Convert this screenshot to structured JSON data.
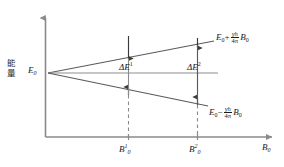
{
  "diagram": {
    "axes": {
      "y_label_chars": [
        "能",
        "量"
      ],
      "y_label_text": "能量",
      "x_label": "B",
      "x_label_sub": "0",
      "origin_label": "E",
      "origin_label_sub": "0"
    },
    "ticks": [
      {
        "name": "first-field-tick",
        "symbol": "B",
        "sub": "0",
        "sup": "1"
      },
      {
        "name": "second-field-tick",
        "symbol": "B",
        "sub": "0",
        "sup": "2"
      }
    ],
    "gaps": [
      {
        "name": "delta-e-1",
        "symbol": "ΔE",
        "sup": "1"
      },
      {
        "name": "delta-e-2",
        "symbol": "ΔE",
        "sup": "2"
      }
    ],
    "branches": [
      {
        "name": "upper-branch",
        "base": "E",
        "base_sub": "0",
        "operator": "+",
        "numerator": "γh",
        "denominator": "4π",
        "field": "B",
        "field_sub": "0"
      },
      {
        "name": "lower-branch",
        "base": "E",
        "base_sub": "0",
        "operator": "−",
        "numerator": "γh",
        "denominator": "4π",
        "field": "B",
        "field_sub": "0"
      }
    ],
    "colors": {
      "axis": "#8a8a8a",
      "line": "#5a5a5a",
      "dashed": "#8a8a8a",
      "text": "#1a1a1a",
      "background": "#ffffff"
    }
  }
}
